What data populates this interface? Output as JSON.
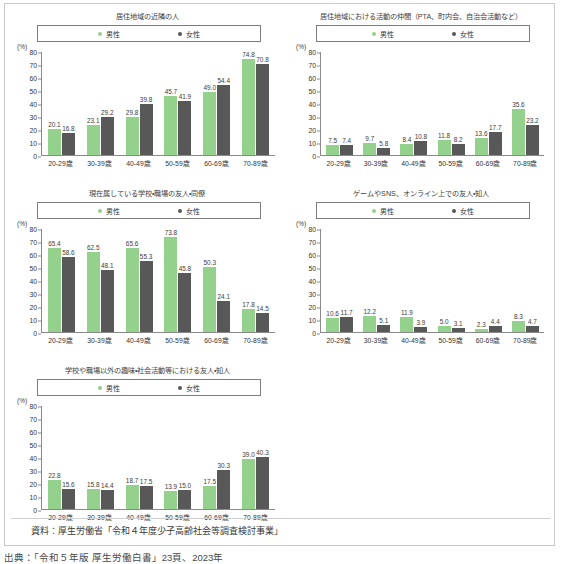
{
  "legend": {
    "male_label": "男性",
    "female_label": "女性",
    "male_color": "#93d18d",
    "female_color": "#585858"
  },
  "axis": {
    "unit": "(%)",
    "y_ticks": [
      "80",
      "70",
      "60",
      "50",
      "40",
      "30",
      "20",
      "10",
      "0"
    ],
    "categories": [
      "20-29歳",
      "30-39歳",
      "40-49歳",
      "50-59歳",
      "60-69歳",
      "70-89歳"
    ]
  },
  "source": {
    "text": "資料：厚生労働省「令和４年度少子高齢社会等調査検討事業」"
  },
  "caption": {
    "text": "出典：「令和５年版 厚生労働白書」23頁、2023年"
  },
  "chart_data": [
    {
      "type": "bar",
      "title": "居住地域の近隣の人",
      "xlabel": "",
      "ylabel": "(%)",
      "ylim": [
        0,
        80
      ],
      "grid": false,
      "legend_position": "top",
      "categories": [
        "20-29歳",
        "30-39歳",
        "40-49歳",
        "50-59歳",
        "60-69歳",
        "70-89歳"
      ],
      "series": [
        {
          "name": "男性",
          "color": "#93d18d",
          "values": [
            20.1,
            23.1,
            29.8,
            45.7,
            49.0,
            74.8
          ]
        },
        {
          "name": "女性",
          "color": "#585858",
          "values": [
            16.8,
            29.2,
            39.8,
            41.9,
            54.4,
            70.8
          ]
        }
      ]
    },
    {
      "type": "bar",
      "title": "居住地域における活動の仲間（PTA、町内会、自治会活動など）",
      "xlabel": "",
      "ylabel": "(%)",
      "ylim": [
        0,
        80
      ],
      "grid": false,
      "legend_position": "top",
      "categories": [
        "20-29歳",
        "30-39歳",
        "40-49歳",
        "50-59歳",
        "60-69歳",
        "70-89歳"
      ],
      "series": [
        {
          "name": "男性",
          "color": "#93d18d",
          "values": [
            7.5,
            9.7,
            8.4,
            11.8,
            13.6,
            35.6
          ]
        },
        {
          "name": "女性",
          "color": "#585858",
          "values": [
            7.4,
            5.8,
            10.8,
            8.2,
            17.7,
            23.2
          ]
        }
      ]
    },
    {
      "type": "bar",
      "title": "現在属している学校・職場の友人・同僚",
      "xlabel": "",
      "ylabel": "(%)",
      "ylim": [
        0,
        80
      ],
      "grid": false,
      "legend_position": "top",
      "categories": [
        "20-29歳",
        "30-39歳",
        "40-49歳",
        "50-59歳",
        "60-69歳",
        "70-89歳"
      ],
      "series": [
        {
          "name": "男性",
          "color": "#93d18d",
          "values": [
            65.4,
            62.5,
            65.6,
            73.8,
            50.3,
            17.8
          ]
        },
        {
          "name": "女性",
          "color": "#585858",
          "values": [
            58.6,
            48.1,
            55.3,
            45.8,
            24.1,
            14.5
          ]
        }
      ]
    },
    {
      "type": "bar",
      "title": "ゲームやSNS、オンライン上での友人・知人",
      "xlabel": "",
      "ylabel": "(%)",
      "ylim": [
        0,
        80
      ],
      "grid": false,
      "legend_position": "top",
      "categories": [
        "20-29歳",
        "30-39歳",
        "40-49歳",
        "50-59歳",
        "60-69歳",
        "70-89歳"
      ],
      "series": [
        {
          "name": "男性",
          "color": "#93d18d",
          "values": [
            10.6,
            12.2,
            11.9,
            5.0,
            2.3,
            8.3
          ]
        },
        {
          "name": "女性",
          "color": "#585858",
          "values": [
            11.7,
            5.1,
            3.9,
            3.1,
            4.4,
            4.7
          ]
        }
      ]
    },
    {
      "type": "bar",
      "title": "学校や職場以外の趣味・社会活動等における友人・知人",
      "xlabel": "",
      "ylabel": "(%)",
      "ylim": [
        0,
        80
      ],
      "grid": false,
      "legend_position": "top",
      "categories": [
        "20-29歳",
        "30-39歳",
        "40-49歳",
        "50-59歳",
        "60-69歳",
        "70-89歳"
      ],
      "series": [
        {
          "name": "男性",
          "color": "#93d18d",
          "values": [
            22.8,
            15.8,
            18.7,
            13.9,
            17.5,
            39.0
          ]
        },
        {
          "name": "女性",
          "color": "#585858",
          "values": [
            15.6,
            14.4,
            17.5,
            15.0,
            30.3,
            40.3
          ]
        }
      ]
    }
  ]
}
